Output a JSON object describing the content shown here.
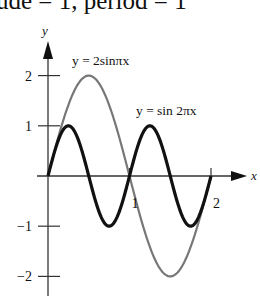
{
  "caption": "ude = 1, period = 1",
  "chart_data": {
    "type": "line",
    "title": "",
    "xlabel": "x",
    "ylabel": "y",
    "xlim": [
      0,
      2
    ],
    "ylim": [
      -2,
      2
    ],
    "x_ticks": [
      {
        "value": 1,
        "label": "1"
      },
      {
        "value": 2,
        "label": "2"
      }
    ],
    "y_ticks": [
      {
        "value": 2,
        "label": "2"
      },
      {
        "value": 1,
        "label": "1"
      },
      {
        "value": -1,
        "label": "−1"
      },
      {
        "value": -2,
        "label": "−2"
      }
    ],
    "grid": false,
    "series": [
      {
        "name": "y = 2 sin πx",
        "label": "y = 2sinπx",
        "function": "2*sin(pi*x)",
        "amplitude": 2,
        "period": 2,
        "color": "#777777",
        "x": [
          0,
          0.25,
          0.5,
          0.75,
          1,
          1.25,
          1.5,
          1.75,
          2
        ],
        "values": [
          0,
          1.414,
          2,
          1.414,
          0,
          -1.414,
          -2,
          -1.414,
          0
        ]
      },
      {
        "name": "y = sin 2πx",
        "label": "y = sin 2πx",
        "function": "sin(2*pi*x)",
        "amplitude": 1,
        "period": 1,
        "color": "#111111",
        "x": [
          0,
          0.25,
          0.5,
          0.75,
          1,
          1.25,
          1.5,
          1.75,
          2
        ],
        "values": [
          0,
          1,
          0,
          -1,
          0,
          1,
          0,
          -1,
          0
        ]
      }
    ]
  }
}
